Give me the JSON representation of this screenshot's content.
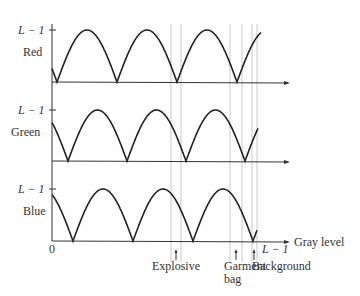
{
  "figure": {
    "channels": [
      {
        "name": "Red",
        "ymax_label": "L − 1",
        "top": 30,
        "base": 82,
        "cusps": [
          57,
          117,
          177,
          237
        ],
        "start_y": 64,
        "end_x": 261,
        "end_y": 37
      },
      {
        "name": "Green",
        "ymax_label": "L − 1",
        "top": 110,
        "base": 161,
        "cusps": [
          68,
          127,
          186,
          247
        ],
        "start_y": 118,
        "end_x": 258,
        "end_y": 131
      },
      {
        "name": "Blue",
        "ymax_label": "L − 1",
        "top": 189,
        "base": 241,
        "cusps": [
          73,
          133,
          192,
          252
        ],
        "start_y": 193,
        "end_x": 257,
        "end_y": 223
      }
    ],
    "x_axis": {
      "label": "Gray level",
      "origin_label": "0",
      "max_label": "L − 1"
    },
    "markers": [
      {
        "label": "Explosive",
        "label_line2": "",
        "x": 176
      },
      {
        "label": "Garment",
        "label_line2": "bag",
        "x": 236
      },
      {
        "label": "Background",
        "label_line2": "",
        "x": 254
      }
    ],
    "guide_lines_x": [
      171,
      181,
      230,
      242,
      252,
      257
    ]
  }
}
